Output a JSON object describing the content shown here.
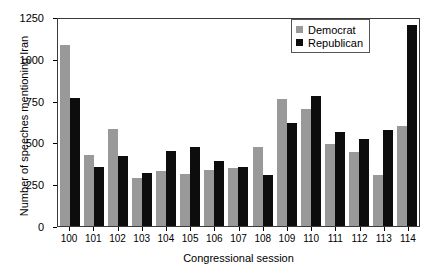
{
  "chart_data": {
    "type": "bar",
    "title": "",
    "xlabel": "Congressional session",
    "ylabel": "Number of speeches mentioning Iran",
    "categories": [
      "100",
      "101",
      "102",
      "103",
      "104",
      "105",
      "106",
      "107",
      "108",
      "109",
      "110",
      "111",
      "112",
      "113",
      "114"
    ],
    "series": [
      {
        "name": "Democrat",
        "color": "#999999",
        "values": [
          1080,
          425,
          580,
          285,
          330,
          310,
          335,
          345,
          470,
          760,
          700,
          490,
          440,
          305,
          600
        ]
      },
      {
        "name": "Republican",
        "color": "#0d0d0d",
        "values": [
          765,
          350,
          420,
          320,
          450,
          470,
          390,
          350,
          305,
          615,
          775,
          560,
          520,
          575,
          1200
        ]
      }
    ],
    "ylim": [
      0,
      1250
    ],
    "yticks": [
      0,
      250,
      500,
      750,
      1000,
      1250
    ],
    "ytick_labels": [
      "0",
      "250",
      "500",
      "750",
      "1000",
      "1250"
    ],
    "grid": false,
    "legend_position": "top-right",
    "legend_entries": [
      "Democrat",
      "Republican"
    ]
  }
}
